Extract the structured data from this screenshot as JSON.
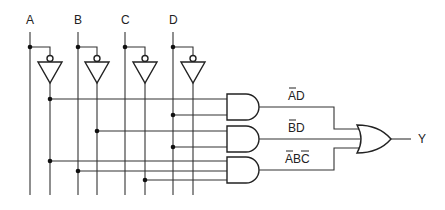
{
  "diagram": {
    "type": "logic-circuit",
    "inputs": [
      {
        "label": "A",
        "x": 30,
        "inv_x": 50
      },
      {
        "label": "B",
        "x": 78,
        "inv_x": 97
      },
      {
        "label": "C",
        "x": 125,
        "inv_x": 145
      },
      {
        "label": "D",
        "x": 173,
        "inv_x": 193
      }
    ],
    "and_gates": [
      {
        "id": "and1",
        "term_label": "AD",
        "overbar_chars": [
          0
        ],
        "inputs": [
          "Ā",
          "D"
        ]
      },
      {
        "id": "and2",
        "term_label": "BD",
        "overbar_chars": [
          0
        ],
        "inputs": [
          "B̄",
          "D"
        ]
      },
      {
        "id": "and3",
        "term_label": "ABC",
        "overbar_chars": [
          0,
          2
        ],
        "inputs": [
          "Ā",
          "B",
          "C̄"
        ]
      }
    ],
    "or_gate": {
      "id": "or1",
      "inputs": [
        "and1",
        "and2",
        "and3"
      ]
    },
    "output": {
      "label": "Y"
    },
    "expression": "Y = ĀD + B̄D + ĀBC̄"
  }
}
